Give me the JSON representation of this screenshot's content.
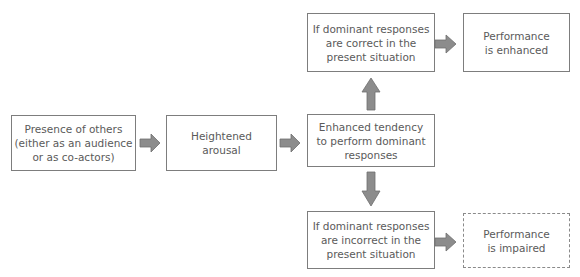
{
  "diagram": {
    "nodes": {
      "presence": "Presence of others\n(either as an audience\nor as co-actors)",
      "arousal": "Heightened\narousal",
      "tendency": "Enhanced tendency\nto perform dominant\nresponses",
      "correct": "If dominant responses\nare correct in the\npresent situation",
      "enhanced": "Performance\nis enhanced",
      "incorrect": "If dominant responses\nare incorrect in the\npresent situation",
      "impaired": "Performance\nis impaired"
    },
    "edges": [
      {
        "from": "presence",
        "to": "arousal"
      },
      {
        "from": "arousal",
        "to": "tendency"
      },
      {
        "from": "tendency",
        "to": "correct"
      },
      {
        "from": "tendency",
        "to": "incorrect"
      },
      {
        "from": "correct",
        "to": "enhanced"
      },
      {
        "from": "incorrect",
        "to": "impaired"
      }
    ],
    "colors": {
      "arrow_fill": "#8c8c8c",
      "arrow_stroke": "#6e6e6e",
      "box_border": "#7d7d7d",
      "text": "#5a5a5a"
    }
  }
}
